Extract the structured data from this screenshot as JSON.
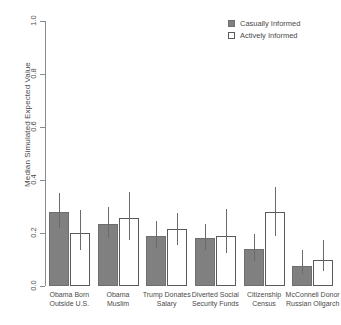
{
  "chart_data": {
    "type": "bar",
    "title": "",
    "xlabel": "",
    "ylabel": "Median Simulated Expected Value",
    "ylim": [
      0.0,
      1.0
    ],
    "ytick_labels": [
      "0.0",
      "0.2",
      "0.4",
      "0.6",
      "0.8",
      "1.0"
    ],
    "ytick_values": [
      0.0,
      0.2,
      0.4,
      0.6,
      0.8,
      1.0
    ],
    "grid": false,
    "legend_position": "top-right",
    "categories": [
      "Obama Born Outside U.S.",
      "Obama Muslim",
      "Trump Donates Salary",
      "Diverted Social Security Funds",
      "Citizenship Census",
      "McConnell Donor Russian Oligarch"
    ],
    "category_lines": [
      [
        "Obama Born",
        "Outside U.S."
      ],
      [
        "Obama",
        "Muslim"
      ],
      [
        "Trump Donates",
        "Salary"
      ],
      [
        "Diverted Social",
        "Security Funds"
      ],
      [
        "Citizenship",
        "Census"
      ],
      [
        "McConnell Donor",
        "Russian Oligarch"
      ]
    ],
    "series": [
      {
        "name": "Casually Informed",
        "color": "#808080",
        "style": "filled",
        "values": [
          0.28,
          0.235,
          0.19,
          0.18,
          0.14,
          0.075
        ],
        "ci_low": [
          0.22,
          0.18,
          0.145,
          0.135,
          0.095,
          0.045
        ],
        "ci_high": [
          0.35,
          0.3,
          0.245,
          0.235,
          0.195,
          0.135
        ]
      },
      {
        "name": "Actively Informed",
        "color": "#ffffff",
        "style": "open",
        "values": [
          0.2,
          0.255,
          0.215,
          0.19,
          0.28,
          0.1
        ],
        "ci_low": [
          0.135,
          0.175,
          0.155,
          0.125,
          0.19,
          0.055
        ],
        "ci_high": [
          0.285,
          0.355,
          0.275,
          0.29,
          0.375,
          0.175
        ]
      }
    ]
  },
  "legend": {
    "items": [
      {
        "label": "Casually Informed",
        "style": "filled"
      },
      {
        "label": "Actively Informed",
        "style": "open"
      }
    ]
  }
}
